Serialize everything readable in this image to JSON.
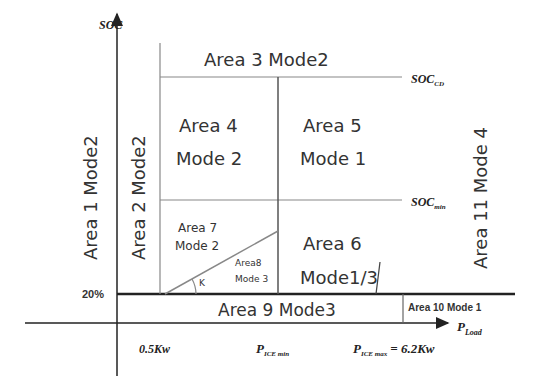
{
  "axes": {
    "y_label": "SOC",
    "x_label_main": "P",
    "x_label_sub": "Load",
    "y_tick_20": "20%",
    "x_tick_05": "0.5Kw",
    "x_tick_pice_min_main": "P",
    "x_tick_pice_min_sub": "ICE min",
    "x_tick_pice_max_main": "P",
    "x_tick_pice_max_sub": "ICE max",
    "x_tick_pice_max_value": "= 6.2Kw"
  },
  "thresholds": {
    "soc_cd_main": "SOC",
    "soc_cd_sub": "CD",
    "soc_min_main": "SOC",
    "soc_min_sub": "min"
  },
  "areas": {
    "a1": "Area 1 Mode2",
    "a2": "Area 2 Mode2",
    "a3": "Area 3 Mode2",
    "a4_line1": "Area 4",
    "a4_line2": "Mode 2",
    "a5_line1": "Area 5",
    "a5_line2": "Mode 1",
    "a6_line1": "Area 6",
    "a6_line2": "Mode1/3",
    "a7_line1": "Area 7",
    "a7_line2": "Mode 2",
    "a8_line1": "Area8",
    "a8_line2": "Mode 3",
    "a9": "Area 9 Mode3",
    "a10": "Area 10 Mode 1",
    "a11": "Area 11 Mode 4",
    "angle_label": "K"
  },
  "colors": {
    "axis": "#222222",
    "grid_line": "#888888",
    "text": "#333333"
  }
}
